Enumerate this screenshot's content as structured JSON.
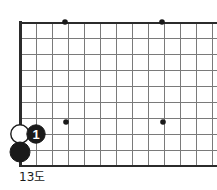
{
  "figure": {
    "caption": "13도",
    "kind": "go-board-diagram",
    "board": {
      "line_color": "#6e6e6e",
      "edge_color": "#2b2b2b",
      "background_color": "#ffffff",
      "cell_size": 16,
      "left_edge_x": 20,
      "top_edge_y": 22,
      "bottom_edge_y": 166,
      "columns": 13,
      "rows": 10,
      "cropped_right": true
    },
    "star_points": [
      {
        "name": "star-point-upper-left",
        "x": 65,
        "y": 22
      },
      {
        "name": "star-point-upper-right",
        "x": 162,
        "y": 22
      },
      {
        "name": "star-point-lower-left",
        "x": 66,
        "y": 122
      },
      {
        "name": "star-point-lower-right",
        "x": 163,
        "y": 122
      }
    ],
    "stones": [
      {
        "id": "white-stone-corner",
        "color": "white",
        "fill": "#ffffff",
        "stroke": "#1a1a1a",
        "x": 20,
        "y": 134,
        "r": 9,
        "label": ""
      },
      {
        "id": "black-stone-move-1",
        "color": "black",
        "fill": "#1a1a1a",
        "stroke": "#1a1a1a",
        "x": 36,
        "y": 134,
        "r": 9,
        "label": "1"
      },
      {
        "id": "black-stone-corner",
        "color": "black",
        "fill": "#1a1a1a",
        "stroke": "#1a1a1a",
        "x": 20,
        "y": 152,
        "r": 10,
        "label": ""
      }
    ]
  }
}
